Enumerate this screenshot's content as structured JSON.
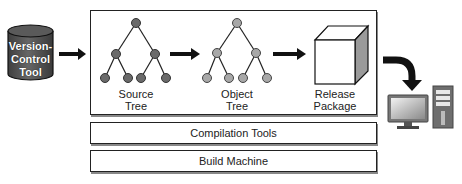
{
  "diagram": {
    "source": {
      "label_line1": "Version-",
      "label_line2": "Control",
      "label_line3": "Tool",
      "shape": "cylinder",
      "color": "#555555"
    },
    "pipeline": {
      "stages": [
        {
          "id": "source-tree",
          "label_line1": "Source",
          "label_line2": "Tree",
          "shape": "binary-tree",
          "node_color": "#6a6a6a"
        },
        {
          "id": "object-tree",
          "label_line1": "Object",
          "label_line2": "Tree",
          "shape": "binary-tree",
          "node_color": "#a8a8a8"
        },
        {
          "id": "release-package",
          "label_line1": "Release",
          "label_line2": "Package",
          "shape": "cube",
          "side_color": "#9a9a9a"
        }
      ]
    },
    "layers": [
      {
        "label": "Compilation Tools"
      },
      {
        "label": "Build Machine"
      }
    ],
    "destination": {
      "shape": "desktop-computer",
      "icon": "computer-icon"
    },
    "edges": [
      {
        "from": "version-control-tool",
        "to": "source-tree"
      },
      {
        "from": "source-tree",
        "to": "object-tree"
      },
      {
        "from": "object-tree",
        "to": "release-package"
      },
      {
        "from": "release-package",
        "to": "desktop-computer",
        "style": "curved"
      }
    ]
  }
}
